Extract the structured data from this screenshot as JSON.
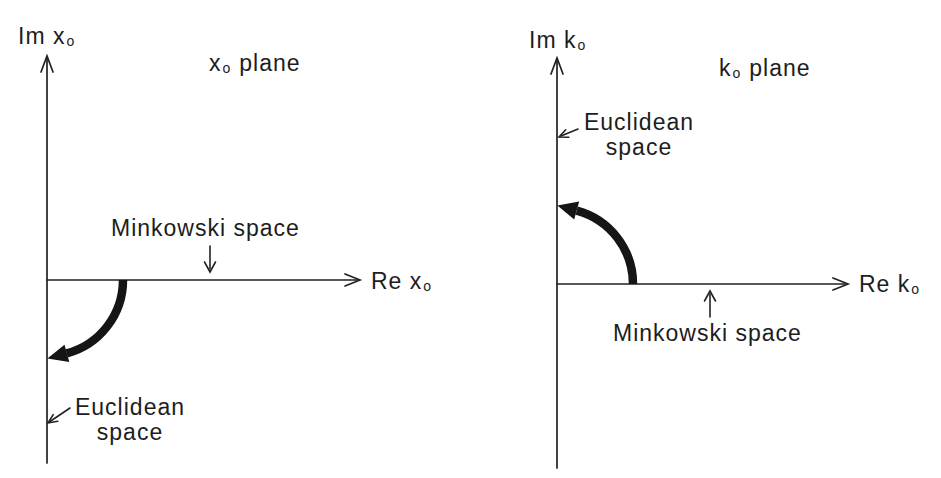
{
  "colors": {
    "ink": "#1d1d1d",
    "arrow_fill": "#151515",
    "background": "#ffffff"
  },
  "left_panel": {
    "title_main": "x",
    "title_sub": "o",
    "title_suffix": "plane",
    "im_axis_main": "Im x",
    "im_axis_sub": "o",
    "re_axis_main": "Re x",
    "re_axis_sub": "o",
    "minkowski_label": "Minkowski space",
    "euclidean_line1": "Euclidean",
    "euclidean_line2": "space",
    "rotation_direction": "clockwise"
  },
  "right_panel": {
    "title_main": "k",
    "title_sub": "o",
    "title_suffix": "plane",
    "im_axis_main": "Im k",
    "im_axis_sub": "o",
    "re_axis_main": "Re k",
    "re_axis_sub": "o",
    "minkowski_label": "Minkowski space",
    "euclidean_line1": "Euclidean",
    "euclidean_line2": "space",
    "rotation_direction": "counterclockwise"
  }
}
